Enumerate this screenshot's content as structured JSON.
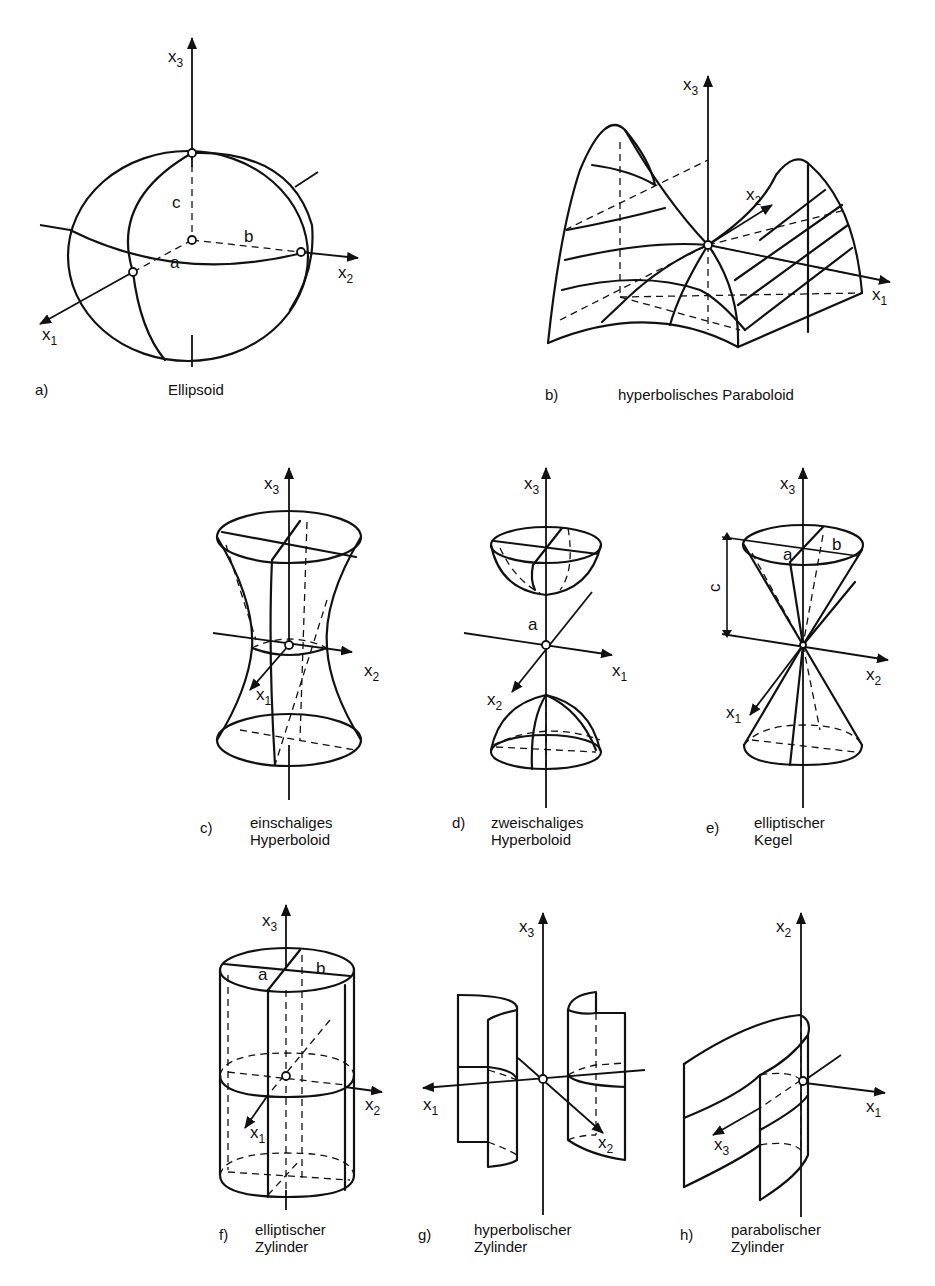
{
  "figures": {
    "a": {
      "letter": "a)",
      "caption": [
        "Ellipsoid"
      ],
      "labels": {
        "x1": "x",
        "x1_sub": "1",
        "x2": "x",
        "x2_sub": "2",
        "x3": "x",
        "x3_sub": "3",
        "a": "a",
        "b": "b",
        "c": "c"
      }
    },
    "b": {
      "letter": "b)",
      "caption": [
        "hyperbolisches Paraboloid"
      ],
      "labels": {
        "x1": "x",
        "x1_sub": "1",
        "x2": "x",
        "x2_sub": "2",
        "x3": "x",
        "x3_sub": "3"
      }
    },
    "c": {
      "letter": "c)",
      "caption": [
        "einschaliges",
        "Hyperboloid"
      ],
      "labels": {
        "x1": "x",
        "x1_sub": "1",
        "x2": "x",
        "x2_sub": "2",
        "x3": "x",
        "x3_sub": "3"
      }
    },
    "d": {
      "letter": "d)",
      "caption": [
        "zweischaliges",
        "Hyperboloid"
      ],
      "labels": {
        "x1": "x",
        "x1_sub": "1",
        "x2": "x",
        "x2_sub": "2",
        "x3": "x",
        "x3_sub": "3",
        "a": "a"
      }
    },
    "e": {
      "letter": "e)",
      "caption": [
        "elliptischer",
        "Kegel"
      ],
      "labels": {
        "x1": "x",
        "x1_sub": "1",
        "x2": "x",
        "x2_sub": "2",
        "x3": "x",
        "x3_sub": "3",
        "a": "a",
        "b": "b",
        "c": "c"
      }
    },
    "f": {
      "letter": "f)",
      "caption": [
        "elliptischer",
        "Zylinder"
      ],
      "labels": {
        "x1": "x",
        "x1_sub": "1",
        "x2": "x",
        "x2_sub": "2",
        "x3": "x",
        "x3_sub": "3",
        "a": "a",
        "b": "b"
      }
    },
    "g": {
      "letter": "g)",
      "caption": [
        "hyperbolischer",
        "Zylinder"
      ],
      "labels": {
        "x1": "x",
        "x1_sub": "1",
        "x2": "x",
        "x2_sub": "2",
        "x3": "x",
        "x3_sub": "3"
      }
    },
    "h": {
      "letter": "h)",
      "caption": [
        "parabolischer",
        "Zylinder"
      ],
      "labels": {
        "x1": "x",
        "x1_sub": "1",
        "x2": "x",
        "x2_sub": "2",
        "x3": "x",
        "x3_sub": "3"
      }
    }
  }
}
